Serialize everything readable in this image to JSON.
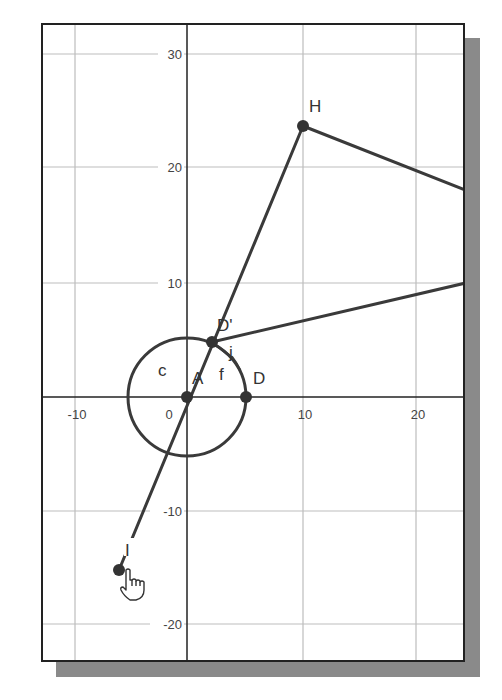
{
  "canvas": {
    "axes": {
      "x_ticks": [
        "-10",
        "0",
        "10",
        "20"
      ],
      "y_ticks": [
        "30",
        "20",
        "10",
        "-10",
        "-20"
      ]
    },
    "objects": {
      "circle": {
        "label": "c"
      },
      "points": {
        "A": "A",
        "D": "D",
        "D_prime": "D'",
        "H": "H",
        "I": "I"
      },
      "arc_label": "f",
      "segment_label": "j"
    },
    "colors": {
      "stroke": "#3a3a3a",
      "grid": "#b8b8b8",
      "axis": "#222222",
      "shadow": "#8a8a8a"
    },
    "cursor_icon": "pointing-hand-icon"
  }
}
